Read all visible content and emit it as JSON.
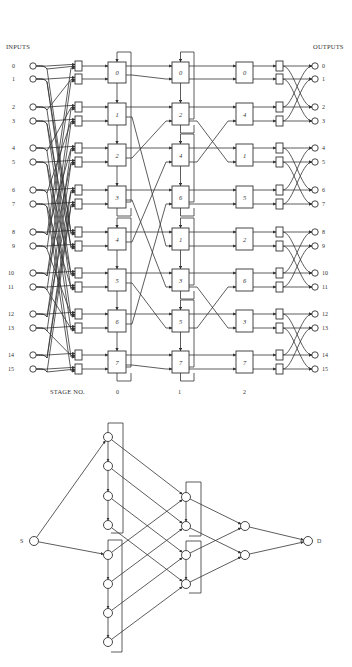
{
  "network": {
    "inputs_label": "INPUTS",
    "outputs_label": "OUTPUTS",
    "stage_label": "STAGE NO.",
    "stage_numbers": [
      "0",
      "1",
      "2"
    ],
    "input_numbers": [
      "0",
      "1",
      "2",
      "3",
      "4",
      "5",
      "6",
      "7",
      "8",
      "9",
      "10",
      "11",
      "12",
      "13",
      "14",
      "15"
    ],
    "output_numbers": [
      "0",
      "1",
      "2",
      "3",
      "4",
      "5",
      "6",
      "7",
      "8",
      "9",
      "10",
      "11",
      "12",
      "13",
      "14",
      "15"
    ],
    "row_y": [
      66,
      79,
      107,
      121,
      148,
      162,
      190,
      204,
      232,
      246,
      273,
      287,
      314,
      328,
      355,
      369
    ],
    "stage0_boxes": [
      "0",
      "1",
      "2",
      "3",
      "4",
      "5",
      "6",
      "7"
    ],
    "stage1_boxes": [
      "0",
      "2",
      "4",
      "6",
      "1",
      "3",
      "5",
      "7"
    ],
    "stage2_boxes": [
      "0",
      "4",
      "1",
      "5",
      "2",
      "6",
      "3",
      "7"
    ],
    "line_color": "#333333"
  },
  "graph": {
    "source_label": "S",
    "dest_label": "D",
    "source": {
      "x": 34,
      "y": 541
    },
    "dest": {
      "x": 308,
      "y": 541
    },
    "col1": [
      {
        "x": 108,
        "y": 437
      },
      {
        "x": 108,
        "y": 466
      },
      {
        "x": 108,
        "y": 496
      },
      {
        "x": 108,
        "y": 525
      },
      {
        "x": 108,
        "y": 555
      },
      {
        "x": 108,
        "y": 584
      },
      {
        "x": 108,
        "y": 613
      },
      {
        "x": 108,
        "y": 642
      }
    ],
    "col2": [
      {
        "x": 186,
        "y": 497
      },
      {
        "x": 186,
        "y": 526
      },
      {
        "x": 186,
        "y": 555
      },
      {
        "x": 186,
        "y": 584
      }
    ],
    "col3": [
      {
        "x": 245,
        "y": 526
      },
      {
        "x": 245,
        "y": 555
      }
    ]
  }
}
